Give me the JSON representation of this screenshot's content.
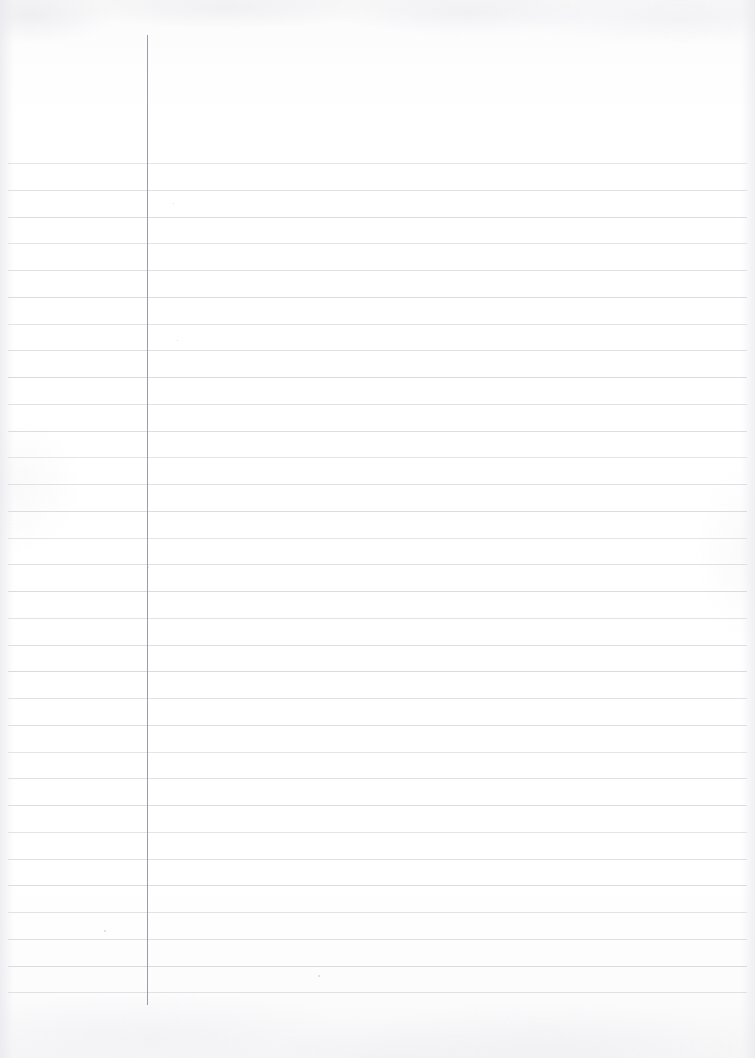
{
  "document": {
    "kind": "ruled-notebook-page",
    "title": "Blank Lined Notebook Page",
    "content_text": "",
    "page_width": 755,
    "page_height": 1058,
    "background_color": "#fdfdfd",
    "is_blank": true
  },
  "ruling": {
    "rule_color": "#d9d9e0",
    "rule_thickness": 1,
    "rule_left": 8,
    "rule_right": 747,
    "first_rule_y": 163,
    "rule_spacing": 26.75,
    "rule_count": 32,
    "margin_line_color": "#9c9ca6",
    "margin_line_x": 147,
    "margin_line_top": 35,
    "margin_line_bottom": 1005,
    "margin_line_thickness": 1
  },
  "artifacts": {
    "specks": [
      {
        "x": 104,
        "y": 930,
        "size": 2
      },
      {
        "x": 318,
        "y": 975,
        "size": 2
      },
      {
        "x": 173,
        "y": 203,
        "size": 1
      },
      {
        "x": 177,
        "y": 340,
        "size": 1
      },
      {
        "x": 148,
        "y": 567,
        "size": 1
      }
    ]
  }
}
